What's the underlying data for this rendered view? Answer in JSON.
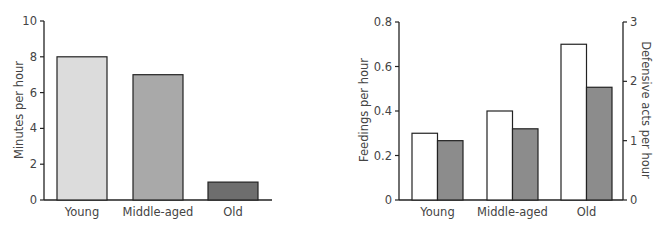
{
  "chart_data": [
    {
      "type": "bar",
      "title": "",
      "categories": [
        "Young",
        "Middle-aged",
        "Old"
      ],
      "values": [
        8,
        7,
        1
      ],
      "xlabel": "",
      "ylabel": "Minutes per hour",
      "ylim": [
        0,
        10
      ],
      "yticks": [
        "0",
        "2",
        "4",
        "6",
        "8",
        "10"
      ],
      "bar_colors": [
        "#dcdcdc",
        "#a9a9a9",
        "#6e6e6e"
      ],
      "grid": false,
      "legend": null
    },
    {
      "type": "bar",
      "title": "",
      "categories": [
        "Young",
        "Middle-aged",
        "Old"
      ],
      "series": [
        {
          "name": "Feedings per hour",
          "axis": "left",
          "values": [
            0.3,
            0.4,
            0.7
          ],
          "color": "#ffffff"
        },
        {
          "name": "Defensive acts per hour",
          "axis": "right",
          "values": [
            1.0,
            1.2,
            1.9
          ],
          "color": "#8c8c8c"
        }
      ],
      "xlabel": "",
      "ylabel": "Feedings per hour",
      "ylabel_right": "Defensive acts per hour",
      "ylim": [
        0,
        0.8
      ],
      "ylim_right": [
        0,
        3
      ],
      "yticks": [
        "0",
        "0.2",
        "0.4",
        "0.6",
        "0.8"
      ],
      "yticks_right": [
        "0",
        "1",
        "2",
        "3"
      ],
      "grid": false,
      "legend": null
    }
  ]
}
